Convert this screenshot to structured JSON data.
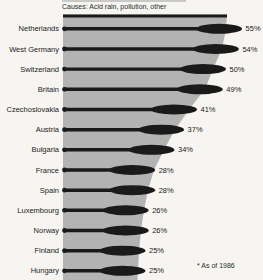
{
  "header": {
    "causes_line": "Causes: Acid rain, pollution, other"
  },
  "footnote": "* As of 1986",
  "colors": {
    "background": "#f6f5f2",
    "silhouette_gray": "#b3b3b3",
    "bar_black": "#1a1a1a",
    "text": "#1a1a1a"
  },
  "chart_data": {
    "type": "bar",
    "orientation": "horizontal",
    "subtitle": "Causes: Acid rain, pollution, other",
    "footnote": "* As of 1986",
    "unit": "%",
    "xlim": [
      0,
      60
    ],
    "categories": [
      "Netherlands",
      "West Germany",
      "Switzerland",
      "Britain",
      "Czechoslovakia",
      "Austria",
      "Bulgaria",
      "France",
      "Spain",
      "Luxembourg",
      "Norway",
      "Finland",
      "Hungary"
    ],
    "values": [
      55,
      54,
      50,
      49,
      41,
      37,
      34,
      28,
      28,
      26,
      26,
      25,
      25
    ],
    "value_labels": [
      "55%",
      "54%",
      "50%",
      "49%",
      "41%",
      "37%",
      "34%",
      "28%",
      "28%",
      "26%",
      "26%",
      "25%",
      "25%"
    ]
  }
}
